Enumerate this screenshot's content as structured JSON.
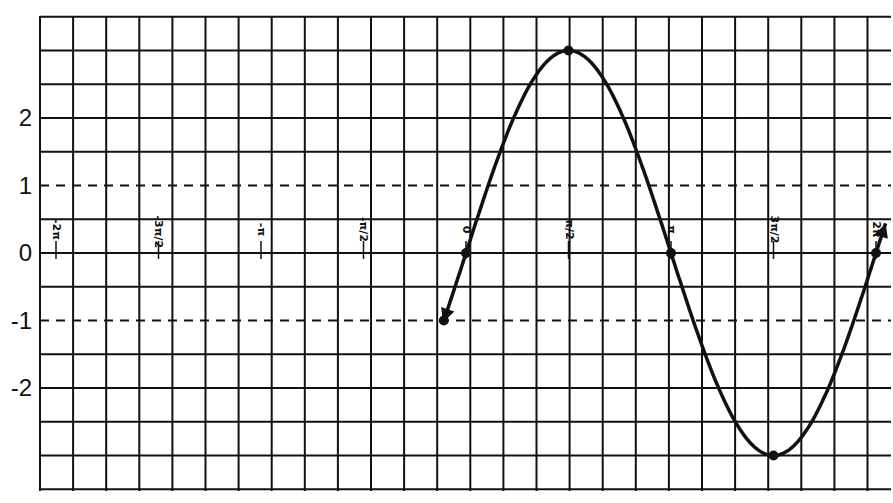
{
  "chart_data": {
    "type": "line",
    "title": "",
    "function": "y = 3 sin(x)",
    "xlabel": "",
    "ylabel": "",
    "x_ticks": [
      {
        "value": -6.2832,
        "label": "-2π"
      },
      {
        "value": -4.7124,
        "label": "-3π/2"
      },
      {
        "value": -3.1416,
        "label": "-π"
      },
      {
        "value": -1.5708,
        "label": "-π/2"
      },
      {
        "value": 0,
        "label": "0"
      },
      {
        "value": 1.5708,
        "label": "π/2"
      },
      {
        "value": 3.1416,
        "label": "π"
      },
      {
        "value": 4.7124,
        "label": "3π/2"
      },
      {
        "value": 6.2832,
        "label": "2π"
      }
    ],
    "y_ticks": [
      {
        "value": 2,
        "label": "2"
      },
      {
        "value": 1,
        "label": "1"
      },
      {
        "value": 0,
        "label": "0"
      },
      {
        "value": -1,
        "label": "-1"
      },
      {
        "value": -2,
        "label": "-2"
      }
    ],
    "dashed_lines_y": [
      1,
      -1
    ],
    "grid": true,
    "xlim": [
      -6.56,
      6.43
    ],
    "ylim": [
      -3.55,
      3.55
    ],
    "series": [
      {
        "name": "3 sin(x)",
        "amplitude": 3,
        "x_range": [
          -0.35,
          6.43
        ],
        "arrows": "both",
        "points": [
          {
            "x": -0.3398,
            "y": -1,
            "marked": true
          },
          {
            "x": 0,
            "y": 0,
            "marked": true
          },
          {
            "x": 1.5708,
            "y": 3,
            "marked": true
          },
          {
            "x": 3.1416,
            "y": 0,
            "marked": true
          },
          {
            "x": 4.7124,
            "y": -3,
            "marked": true
          },
          {
            "x": 6.2832,
            "y": 0,
            "marked": true
          }
        ]
      }
    ]
  },
  "layout": {
    "plot_left": 40,
    "plot_right": 891,
    "plot_top": 16,
    "plot_bottom": 491,
    "origin_x": 466,
    "origin_y": 253,
    "px_per_pi": 205,
    "px_per_unit_y": 67.5,
    "grid_step_x": 33.1,
    "grid_step_y": 33.75,
    "line_color": "#111111"
  }
}
